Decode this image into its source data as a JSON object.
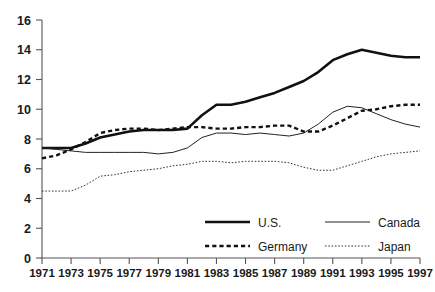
{
  "chart_data": {
    "type": "line",
    "title": "",
    "subtitle": "",
    "xlabel": "",
    "ylabel": "",
    "xlim": [
      1971,
      1997
    ],
    "ylim": [
      0,
      16
    ],
    "yticks": [
      0,
      2,
      4,
      6,
      8,
      10,
      12,
      14,
      16
    ],
    "grid": false,
    "legend_position": "bottom-right",
    "x": [
      1971,
      1972,
      1973,
      1974,
      1975,
      1976,
      1977,
      1978,
      1979,
      1980,
      1981,
      1982,
      1983,
      1984,
      1985,
      1986,
      1987,
      1988,
      1989,
      1990,
      1991,
      1992,
      1993,
      1994,
      1995,
      1996,
      1997
    ],
    "xticks": [
      1971,
      1973,
      1975,
      1977,
      1979,
      1981,
      1983,
      1985,
      1987,
      1989,
      1991,
      1993,
      1995,
      1997
    ],
    "series": [
      {
        "name": "U.S.",
        "style": "thick-solid",
        "color": "#111111",
        "values": [
          7.4,
          7.4,
          7.4,
          7.7,
          8.1,
          8.3,
          8.5,
          8.6,
          8.6,
          8.6,
          8.7,
          9.6,
          10.3,
          10.3,
          10.5,
          10.8,
          11.1,
          11.5,
          11.9,
          12.5,
          13.3,
          13.7,
          14.0,
          13.8,
          13.6,
          13.5,
          13.5
        ]
      },
      {
        "name": "Canada",
        "style": "thin-solid",
        "color": "#222222",
        "values": [
          7.4,
          7.3,
          7.2,
          7.1,
          7.1,
          7.1,
          7.1,
          7.1,
          7.0,
          7.1,
          7.4,
          8.1,
          8.4,
          8.4,
          8.3,
          8.4,
          8.3,
          8.2,
          8.4,
          9.0,
          9.8,
          10.2,
          10.1,
          9.7,
          9.3,
          9.0,
          8.8
        ]
      },
      {
        "name": "Germany",
        "style": "dashed",
        "color": "#111111",
        "values": [
          6.7,
          6.9,
          7.3,
          7.8,
          8.4,
          8.6,
          8.7,
          8.7,
          8.6,
          8.7,
          8.8,
          8.8,
          8.7,
          8.7,
          8.8,
          8.8,
          8.9,
          8.9,
          8.5,
          8.5,
          8.9,
          9.4,
          9.9,
          10.0,
          10.2,
          10.3,
          10.3
        ]
      },
      {
        "name": "Japan",
        "style": "dotted",
        "color": "#333333",
        "values": [
          4.5,
          4.5,
          4.5,
          4.9,
          5.5,
          5.6,
          5.8,
          5.9,
          6.0,
          6.2,
          6.3,
          6.5,
          6.5,
          6.4,
          6.5,
          6.5,
          6.5,
          6.4,
          6.1,
          5.9,
          5.9,
          6.2,
          6.5,
          6.8,
          7.0,
          7.1,
          7.2
        ]
      }
    ],
    "legend": [
      {
        "label": "U.S.",
        "style": "thick-solid"
      },
      {
        "label": "Canada",
        "style": "thin-solid"
      },
      {
        "label": "Germany",
        "style": "dashed"
      },
      {
        "label": "Japan",
        "style": "dotted"
      }
    ]
  }
}
